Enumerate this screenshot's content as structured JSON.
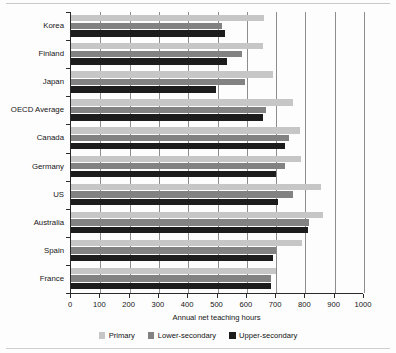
{
  "chart_data": {
    "type": "bar",
    "orientation": "horizontal",
    "title": "",
    "xlabel": "Annual net teaching hours",
    "ylabel": "",
    "xlim": [
      0,
      1000
    ],
    "xticks": [
      0,
      100,
      200,
      300,
      400,
      500,
      600,
      700,
      800,
      900,
      1000
    ],
    "grid": true,
    "grid_axis": "x",
    "legend_position": "bottom",
    "categories": [
      "Korea",
      "Finland",
      "Japan",
      "OECD Average",
      "Canada",
      "Germany",
      "US",
      "Australia",
      "Spain",
      "France"
    ],
    "series": [
      {
        "name": "Primary",
        "color": "#c6c6c6",
        "values": [
          660,
          655,
          690,
          757,
          780,
          785,
          853,
          860,
          790,
          700
        ]
      },
      {
        "name": "Lower-secondary",
        "color": "#828282",
        "values": [
          515,
          585,
          595,
          665,
          744,
          730,
          757,
          812,
          700,
          683
        ]
      },
      {
        "name": "Upper-secondary",
        "color": "#1c1c1c",
        "values": [
          525,
          533,
          495,
          655,
          730,
          700,
          707,
          808,
          690,
          683
        ]
      }
    ]
  },
  "axis": {
    "x_title": "Annual net teaching hours",
    "tick_labels": [
      "0",
      "100",
      "200",
      "300",
      "400",
      "500",
      "600",
      "700",
      "800",
      "900",
      "1000"
    ]
  },
  "legend": {
    "items": [
      {
        "label": "Primary",
        "color": "#c6c6c6"
      },
      {
        "label": "Lower-secondary",
        "color": "#828282"
      },
      {
        "label": "Upper-secondary",
        "color": "#1c1c1c"
      }
    ]
  }
}
